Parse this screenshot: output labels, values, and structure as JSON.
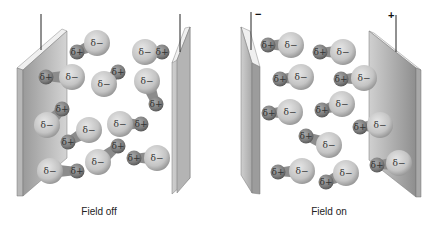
{
  "panels": [
    {
      "id": "field-off",
      "caption": "Field off",
      "left_terminal": "",
      "right_terminal": "",
      "molecules": [
        {
          "neg": [
            97,
            43
          ],
          "pos": [
            77,
            52
          ]
        },
        {
          "neg": [
            72,
            77
          ],
          "pos": [
            46,
            77
          ]
        },
        {
          "neg": [
            104,
            84
          ],
          "pos": [
            118,
            72
          ]
        },
        {
          "neg": [
            145,
            52
          ],
          "pos": [
            162,
            52
          ]
        },
        {
          "neg": [
            147,
            81
          ],
          "pos": [
            156,
            104
          ]
        },
        {
          "neg": [
            47,
            125
          ],
          "pos": [
            62,
            109
          ]
        },
        {
          "neg": [
            89,
            130
          ],
          "pos": [
            68,
            142
          ]
        },
        {
          "neg": [
            120,
            124
          ],
          "pos": [
            141,
            124
          ]
        },
        {
          "neg": [
            50,
            171
          ],
          "pos": [
            77,
            171
          ]
        },
        {
          "neg": [
            98,
            162
          ],
          "pos": [
            118,
            146
          ]
        },
        {
          "neg": [
            157,
            158
          ],
          "pos": [
            134,
            158
          ]
        }
      ]
    },
    {
      "id": "field-on",
      "caption": "Field on",
      "left_terminal": "−",
      "right_terminal": "+",
      "molecules": [
        {
          "neg": [
            291,
            45
          ],
          "pos": [
            268,
            45
          ]
        },
        {
          "neg": [
            343,
            52
          ],
          "pos": [
            320,
            52
          ]
        },
        {
          "neg": [
            301,
            77
          ],
          "pos": [
            280,
            79
          ]
        },
        {
          "neg": [
            364,
            78
          ],
          "pos": [
            341,
            79
          ]
        },
        {
          "neg": [
            290,
            112
          ],
          "pos": [
            269,
            113
          ]
        },
        {
          "neg": [
            342,
            104
          ],
          "pos": [
            322,
            110
          ]
        },
        {
          "neg": [
            380,
            125
          ],
          "pos": [
            360,
            127
          ]
        },
        {
          "neg": [
            329,
            145
          ],
          "pos": [
            306,
            136
          ]
        },
        {
          "neg": [
            302,
            171
          ],
          "pos": [
            278,
            172
          ]
        },
        {
          "neg": [
            346,
            173
          ],
          "pos": [
            326,
            182
          ]
        },
        {
          "neg": [
            399,
            163
          ],
          "pos": [
            377,
            165
          ]
        }
      ]
    }
  ],
  "labels": {
    "neg": "δ−",
    "pos": "δ+"
  }
}
